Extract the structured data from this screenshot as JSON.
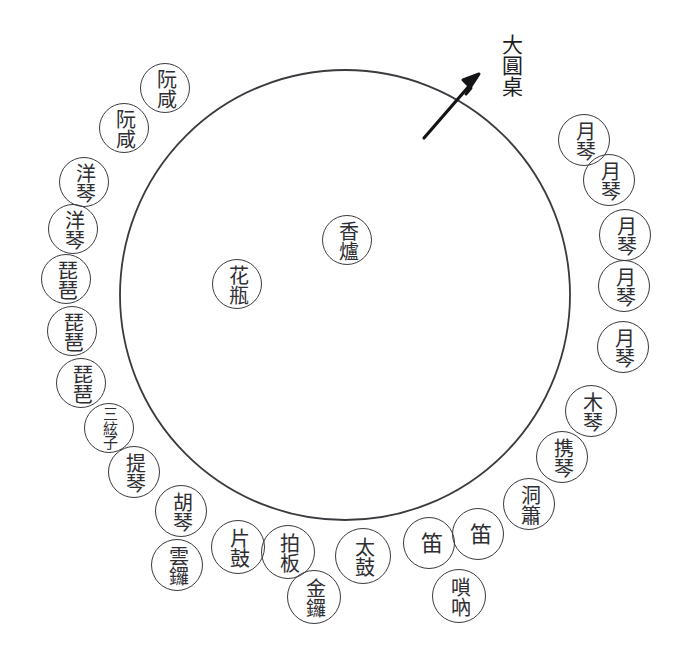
{
  "diagram": {
    "title_annotation": "大圓桌",
    "table": {
      "name": "大圓桌",
      "cx": 345,
      "cy": 295,
      "r": 225
    },
    "arrow": {
      "name": "table-pointer-arrow",
      "from_x": 424,
      "from_y": 138,
      "to_x": 477,
      "to_y": 78
    }
  },
  "table_items": [
    {
      "label": "香爐",
      "role": "incense-burner",
      "cx": 347,
      "cy": 240,
      "r": 25
    },
    {
      "label": "花瓶",
      "role": "flower-vase",
      "cx": 237,
      "cy": 284,
      "r": 25
    }
  ],
  "performers": [
    {
      "label": "阮咸",
      "role": "ruanxian",
      "cx": 165,
      "cy": 88,
      "r": 25
    },
    {
      "label": "阮咸",
      "role": "ruanxian",
      "cx": 124,
      "cy": 128,
      "r": 25
    },
    {
      "label": "洋琴",
      "role": "yangqin",
      "cx": 84,
      "cy": 182,
      "r": 25
    },
    {
      "label": "洋琴",
      "role": "yangqin",
      "cx": 73,
      "cy": 229,
      "r": 25
    },
    {
      "label": "琵琶",
      "role": "pipa",
      "cx": 66,
      "cy": 279,
      "r": 25
    },
    {
      "label": "琵琶",
      "role": "pipa",
      "cx": 72,
      "cy": 331,
      "r": 25
    },
    {
      "label": "琵琶",
      "role": "pipa",
      "cx": 81,
      "cy": 383,
      "r": 25
    },
    {
      "label": "三絃子",
      "role": "sanxianzi",
      "cx": 109,
      "cy": 428,
      "r": 25
    },
    {
      "label": "提琴",
      "role": "tiqin",
      "cx": 134,
      "cy": 472,
      "r": 26
    },
    {
      "label": "胡琴",
      "role": "huqin",
      "cx": 181,
      "cy": 511,
      "r": 26
    },
    {
      "label": "雲鑼",
      "role": "yunluo",
      "cx": 177,
      "cy": 565,
      "r": 26
    },
    {
      "label": "片鼓",
      "role": "piangu",
      "cx": 238,
      "cy": 547,
      "r": 27
    },
    {
      "label": "拍板",
      "role": "paiban",
      "cx": 288,
      "cy": 552,
      "r": 27
    },
    {
      "label": "金鑼",
      "role": "jinluo",
      "cx": 314,
      "cy": 597,
      "r": 27
    },
    {
      "label": "太鼓",
      "role": "taigu",
      "cx": 363,
      "cy": 556,
      "r": 28
    },
    {
      "label": "笛",
      "role": "di",
      "cx": 429,
      "cy": 543,
      "r": 26
    },
    {
      "label": "笛",
      "role": "di",
      "cx": 478,
      "cy": 534,
      "r": 26
    },
    {
      "label": "嗩吶",
      "role": "suona",
      "cx": 459,
      "cy": 596,
      "r": 27
    },
    {
      "label": "洞簫",
      "role": "dongxiao",
      "cx": 529,
      "cy": 504,
      "r": 26
    },
    {
      "label": "携琴",
      "role": "xieqin",
      "cx": 562,
      "cy": 457,
      "r": 26
    },
    {
      "label": "木琴",
      "role": "muqin",
      "cx": 591,
      "cy": 411,
      "r": 26
    },
    {
      "label": "月琴",
      "role": "yueqin",
      "cx": 623,
      "cy": 347,
      "r": 26
    },
    {
      "label": "月琴",
      "role": "yueqin",
      "cx": 624,
      "cy": 286,
      "r": 26
    },
    {
      "label": "月琴",
      "role": "yueqin",
      "cx": 625,
      "cy": 235,
      "r": 26
    },
    {
      "label": "月琴",
      "role": "yueqin",
      "cx": 609,
      "cy": 180,
      "r": 26
    },
    {
      "label": "月琴",
      "role": "yueqin",
      "cx": 584,
      "cy": 140,
      "r": 26
    }
  ]
}
